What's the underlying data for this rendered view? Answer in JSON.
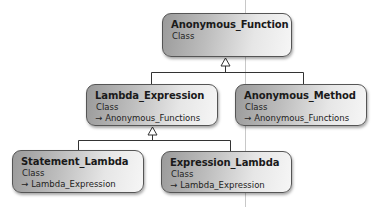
{
  "diagram": {
    "type": "class-inheritance",
    "nodes": [
      {
        "id": "anonymous_function",
        "title": "Anonymous_Function",
        "kind": "Class",
        "parent": null
      },
      {
        "id": "lambda_expression",
        "title": "Lambda_Expression",
        "kind": "Class",
        "parent": "Anonymous_Functions"
      },
      {
        "id": "anonymous_method",
        "title": "Anonymous_Method",
        "kind": "Class",
        "parent": "Anonymous_Functions"
      },
      {
        "id": "statement_lambda",
        "title": "Statement_Lambda",
        "kind": "Class",
        "parent": "Lambda_Expression"
      },
      {
        "id": "expression_lambda",
        "title": "Expression_Lambda",
        "kind": "Class",
        "parent": "Lambda_Expression"
      }
    ],
    "inherit_icon": "inherits-arrow-icon",
    "inherit_glyph": "→",
    "colors": {
      "border": "#555555",
      "gradient_dark": "#9a9a9a",
      "gradient_light": "#f6f6f6",
      "connector": "#333333"
    }
  }
}
